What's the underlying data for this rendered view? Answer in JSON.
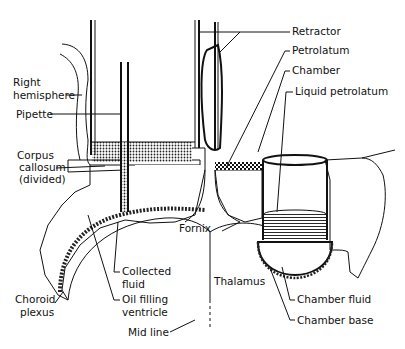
{
  "diagram": {
    "type": "anatomical-schematic",
    "labels": {
      "retractor": "Retractor",
      "right_hemisphere_1": "Right",
      "right_hemisphere_2": "hemisphere",
      "pipette": "Pipette",
      "corpus_1": "Corpus",
      "corpus_2": "callosum",
      "corpus_3": "(divided)",
      "petrolatum": "Petrolatum",
      "chamber": "Chamber",
      "liquid_petrolatum": "Liquid petrolatum",
      "fornix": "Fornix",
      "thalamus": "Thalamus",
      "collected_1": "Collected",
      "collected_2": "fluid",
      "oil_1": "Oil filling",
      "oil_2": "ventricle",
      "choroid_1": "Choroid",
      "choroid_2": "plexus",
      "chamber_fluid": "Chamber fluid",
      "chamber_base": "Chamber base",
      "mid_line": "Mid line"
    },
    "colors": {
      "ink": "#111111",
      "background": "#ffffff"
    }
  }
}
